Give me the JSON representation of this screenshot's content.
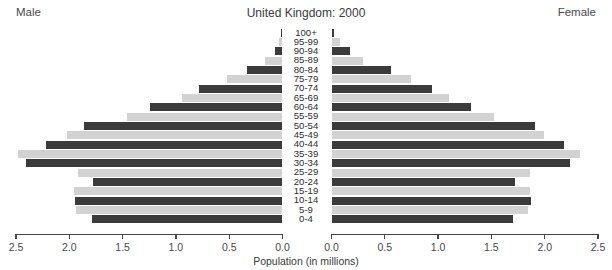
{
  "header": {
    "male_label": "Male",
    "female_label": "Female",
    "title": "United Kingdom: 2000"
  },
  "axis": {
    "title": "Population (in millions)",
    "left_ticks": [
      "2.5",
      "2.0",
      "1.5",
      "1.0",
      "0.5",
      "0.0"
    ],
    "right_ticks": [
      "0.0",
      "0.5",
      "1.0",
      "1.5",
      "2.0",
      "2.5"
    ]
  },
  "chart_data": {
    "type": "bar",
    "subtype": "population-pyramid",
    "title": "United Kingdom: 2000",
    "xlabel": "Population (in millions)",
    "ylabel": "",
    "xlim": [
      0,
      2.5
    ],
    "grid": false,
    "legend": [
      "Male",
      "Female"
    ],
    "legend_position": "top-corners",
    "categories": [
      "100+",
      "95-99",
      "90-94",
      "85-89",
      "80-84",
      "75-79",
      "70-74",
      "65-69",
      "60-64",
      "55-59",
      "50-54",
      "45-49",
      "40-44",
      "35-39",
      "30-34",
      "25-29",
      "20-24",
      "15-19",
      "10-14",
      "5-9",
      "0-4"
    ],
    "series": [
      {
        "name": "Male",
        "side": "left",
        "values": [
          0.01,
          0.03,
          0.07,
          0.16,
          0.33,
          0.52,
          0.78,
          0.94,
          1.24,
          1.46,
          1.86,
          2.02,
          2.22,
          2.48,
          2.41,
          1.92,
          1.78,
          1.96,
          1.95,
          1.94,
          1.79
        ]
      },
      {
        "name": "Female",
        "side": "right",
        "values": [
          0.02,
          0.08,
          0.17,
          0.3,
          0.56,
          0.75,
          0.94,
          1.1,
          1.31,
          1.52,
          1.91,
          1.99,
          2.18,
          2.33,
          2.24,
          1.86,
          1.72,
          1.86,
          1.87,
          1.84,
          1.7
        ]
      }
    ],
    "bar_colors": {
      "dark": "#3b3b3b",
      "light": "#d2d2d2"
    },
    "bar_color_pattern": "alternating by age band, top band dark"
  }
}
